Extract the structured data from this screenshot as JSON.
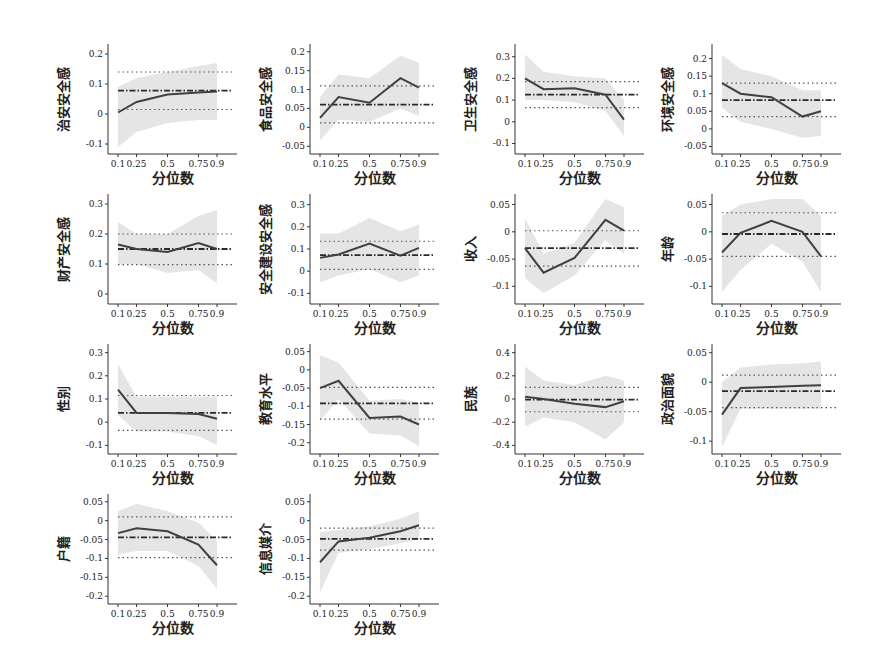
{
  "chart_data": {
    "type": "line",
    "layout": "grid of small multiples, 4 columns x 4 rows (last row has 2 panels)",
    "shared": {
      "xlabel": "分位数",
      "x": [
        0.1,
        0.25,
        0.5,
        0.75,
        0.9
      ],
      "x_tick_labels": [
        "0.1",
        "0.25",
        "0.5",
        "0.75",
        "0.9"
      ],
      "series_styles": {
        "band": "quantile regression 95% confidence band (light gray fill)",
        "qr": "quantile regression coefficient (solid dark line)",
        "ols": "OLS coefficient (dash-dot horizontal line)",
        "ols_ci": "OLS confidence bounds (dotted horizontal lines)"
      },
      "colors": {
        "band": "#dcdcdc",
        "line": "#404040",
        "ref": "#555555",
        "axis": "#333333"
      }
    },
    "panels": [
      {
        "ylabel": "治安安全感",
        "ylim": [
          -0.12,
          0.22
        ],
        "yticks": [
          "-0.1",
          "0",
          "0.1",
          "0.2"
        ],
        "ytick_values": [
          -0.1,
          0,
          0.1,
          0.2
        ],
        "qr": [
          0.005,
          0.04,
          0.065,
          0.072,
          0.075
        ],
        "band_low": [
          -0.11,
          -0.06,
          -0.03,
          -0.02,
          -0.02
        ],
        "band_high": [
          0.09,
          0.12,
          0.14,
          0.16,
          0.17
        ],
        "ols": 0.078,
        "ols_low": 0.015,
        "ols_high": 0.14
      },
      {
        "ylabel": "食品安全感",
        "ylim": [
          -0.06,
          0.21
        ],
        "yticks": [
          "-0.05",
          "0",
          "0.05",
          "0.1",
          "0.15",
          "0.2"
        ],
        "ytick_values": [
          -0.05,
          0,
          0.05,
          0.1,
          0.15,
          0.2
        ],
        "qr": [
          0.025,
          0.08,
          0.065,
          0.13,
          0.105
        ],
        "band_low": [
          -0.035,
          0.02,
          0.015,
          0.05,
          0.03
        ],
        "band_high": [
          0.08,
          0.14,
          0.13,
          0.19,
          0.17
        ],
        "ols": 0.06,
        "ols_low": 0.012,
        "ols_high": 0.11
      },
      {
        "ylabel": "卫生安全感",
        "ylim": [
          -0.13,
          0.34
        ],
        "yticks": [
          "-0.1",
          "0",
          "0.1",
          "0.2",
          "0.3"
        ],
        "ytick_values": [
          -0.1,
          0,
          0.1,
          0.2,
          0.3
        ],
        "qr": [
          0.2,
          0.15,
          0.155,
          0.125,
          0.01
        ],
        "band_low": [
          0.1,
          0.1,
          0.09,
          0.05,
          -0.065
        ],
        "band_high": [
          0.31,
          0.23,
          0.21,
          0.2,
          0.1
        ],
        "ols": 0.125,
        "ols_low": 0.065,
        "ols_high": 0.185
      },
      {
        "ylabel": "环境安全感",
        "ylim": [
          -0.06,
          0.23
        ],
        "yticks": [
          "-0.05",
          "0",
          "0.05",
          "0.1",
          "0.15",
          "0.2"
        ],
        "ytick_values": [
          -0.05,
          0,
          0.05,
          0.1,
          0.15,
          0.2
        ],
        "qr": [
          0.13,
          0.1,
          0.09,
          0.035,
          0.05
        ],
        "band_low": [
          0.06,
          0.02,
          0.0,
          -0.025,
          -0.02
        ],
        "band_high": [
          0.21,
          0.17,
          0.15,
          0.11,
          0.11
        ],
        "ols": 0.082,
        "ols_low": 0.035,
        "ols_high": 0.13
      },
      {
        "ylabel": "财产安全感",
        "ylim": [
          -0.02,
          0.32
        ],
        "yticks": [
          "0",
          "0.1",
          "0.2",
          "0.3"
        ],
        "ytick_values": [
          0,
          0.1,
          0.2,
          0.3
        ],
        "qr": [
          0.165,
          0.15,
          0.14,
          0.17,
          0.15
        ],
        "band_low": [
          0.1,
          0.1,
          0.07,
          0.08,
          0.035
        ],
        "band_high": [
          0.24,
          0.2,
          0.2,
          0.26,
          0.28
        ],
        "ols": 0.15,
        "ols_low": 0.098,
        "ols_high": 0.2
      },
      {
        "ylabel": "安全建设安全感",
        "ylim": [
          -0.13,
          0.33
        ],
        "yticks": [
          "-0.1",
          "0",
          "0.1",
          "0.2",
          "0.3"
        ],
        "ytick_values": [
          -0.1,
          0,
          0.1,
          0.2,
          0.3
        ],
        "qr": [
          0.06,
          0.075,
          0.125,
          0.07,
          0.105
        ],
        "band_low": [
          -0.05,
          -0.02,
          0.01,
          -0.05,
          -0.02
        ],
        "band_high": [
          0.17,
          0.17,
          0.24,
          0.18,
          0.21
        ],
        "ols": 0.072,
        "ols_low": 0.008,
        "ols_high": 0.135
      },
      {
        "ylabel": "收入",
        "ylim": [
          -0.125,
          0.062
        ],
        "yticks": [
          "-0.1",
          "-0.05",
          "0",
          "0.05"
        ],
        "ytick_values": [
          -0.1,
          -0.05,
          0,
          0.05
        ],
        "qr": [
          -0.03,
          -0.075,
          -0.048,
          0.022,
          0.002
        ],
        "band_low": [
          -0.085,
          -0.112,
          -0.08,
          -0.015,
          -0.04
        ],
        "band_high": [
          0.025,
          -0.04,
          -0.02,
          0.06,
          0.045
        ],
        "ols": -0.03,
        "ols_low": -0.063,
        "ols_high": 0.002
      },
      {
        "ylabel": "年龄",
        "ylim": [
          -0.125,
          0.062
        ],
        "yticks": [
          "-0.1",
          "-0.05",
          "0",
          "0.05"
        ],
        "ytick_values": [
          -0.1,
          -0.05,
          0,
          0.05
        ],
        "qr": [
          -0.038,
          -0.002,
          0.02,
          0.0,
          -0.045
        ],
        "band_low": [
          -0.11,
          -0.07,
          -0.022,
          -0.055,
          -0.11
        ],
        "band_high": [
          0.03,
          0.05,
          0.06,
          0.06,
          0.03
        ],
        "ols": -0.004,
        "ols_low": -0.045,
        "ols_high": 0.035
      },
      {
        "ylabel": "性别",
        "ylim": [
          -0.12,
          0.32
        ],
        "yticks": [
          "-0.1",
          "0",
          "0.1",
          "0.2",
          "0.3"
        ],
        "ytick_values": [
          -0.1,
          0,
          0.1,
          0.2,
          0.3
        ],
        "qr": [
          0.14,
          0.04,
          0.04,
          0.035,
          0.015
        ],
        "band_low": [
          0.03,
          -0.04,
          -0.04,
          -0.06,
          -0.1
        ],
        "band_high": [
          0.25,
          0.11,
          0.11,
          0.11,
          0.11
        ],
        "ols": 0.04,
        "ols_low": -0.035,
        "ols_high": 0.115
      },
      {
        "ylabel": "教育水平",
        "ylim": [
          -0.22,
          0.06
        ],
        "yticks": [
          "-0.2",
          "-0.15",
          "-0.1",
          "-0.05",
          "0",
          "0.05"
        ],
        "ytick_values": [
          -0.2,
          -0.15,
          -0.1,
          -0.05,
          0,
          0.05
        ],
        "qr": [
          -0.05,
          -0.03,
          -0.132,
          -0.128,
          -0.15
        ],
        "band_low": [
          -0.14,
          -0.08,
          -0.175,
          -0.18,
          -0.21
        ],
        "band_high": [
          0.04,
          0.02,
          -0.085,
          -0.08,
          -0.09
        ],
        "ols": -0.092,
        "ols_low": -0.135,
        "ols_high": -0.048
      },
      {
        "ylabel": "民族",
        "ylim": [
          -0.44,
          0.44
        ],
        "yticks": [
          "-0.4",
          "-0.2",
          "0",
          "0.2",
          "0.4"
        ],
        "ytick_values": [
          -0.4,
          -0.2,
          0,
          0.2,
          0.4
        ],
        "qr": [
          0.02,
          0.0,
          -0.04,
          -0.07,
          -0.02
        ],
        "band_low": [
          -0.24,
          -0.16,
          -0.2,
          -0.35,
          -0.2
        ],
        "band_high": [
          0.28,
          0.16,
          0.12,
          0.2,
          0.16
        ],
        "ols": -0.005,
        "ols_low": -0.11,
        "ols_high": 0.1
      },
      {
        "ylabel": "政治面貌",
        "ylim": [
          -0.115,
          0.058
        ],
        "yticks": [
          "-0.1",
          "-0.05",
          "0",
          "0.05"
        ],
        "ytick_values": [
          -0.1,
          -0.05,
          0,
          0.05
        ],
        "qr": [
          -0.055,
          -0.01,
          -0.008,
          -0.006,
          -0.005
        ],
        "band_low": [
          -0.11,
          -0.045,
          -0.045,
          -0.045,
          -0.045
        ],
        "band_high": [
          0.0,
          0.025,
          0.03,
          0.032,
          0.035
        ],
        "ols": -0.015,
        "ols_low": -0.043,
        "ols_high": 0.012
      },
      {
        "ylabel": "户籍",
        "ylim": [
          -0.21,
          0.06
        ],
        "yticks": [
          "-0.2",
          "-0.15",
          "-0.1",
          "-0.05",
          "0",
          "0.05"
        ],
        "ytick_values": [
          -0.2,
          -0.15,
          -0.1,
          -0.05,
          0,
          0.05
        ],
        "qr": [
          -0.033,
          -0.02,
          -0.028,
          -0.063,
          -0.118
        ],
        "band_low": [
          -0.09,
          -0.08,
          -0.08,
          -0.12,
          -0.18
        ],
        "band_high": [
          0.025,
          0.045,
          0.025,
          -0.005,
          -0.055
        ],
        "ols": -0.044,
        "ols_low": -0.098,
        "ols_high": 0.01
      },
      {
        "ylabel": "信息媒介",
        "ylim": [
          -0.21,
          0.06
        ],
        "yticks": [
          "-0.2",
          "-0.15",
          "-0.1",
          "-0.05",
          "0",
          "0.05"
        ],
        "ytick_values": [
          -0.2,
          -0.15,
          -0.1,
          -0.05,
          0,
          0.05
        ],
        "qr": [
          -0.11,
          -0.055,
          -0.045,
          -0.028,
          -0.012
        ],
        "band_low": [
          -0.19,
          -0.085,
          -0.075,
          -0.06,
          -0.05
        ],
        "band_high": [
          -0.03,
          -0.025,
          -0.015,
          0.005,
          0.025
        ],
        "ols": -0.048,
        "ols_low": -0.078,
        "ols_high": -0.02
      }
    ]
  }
}
